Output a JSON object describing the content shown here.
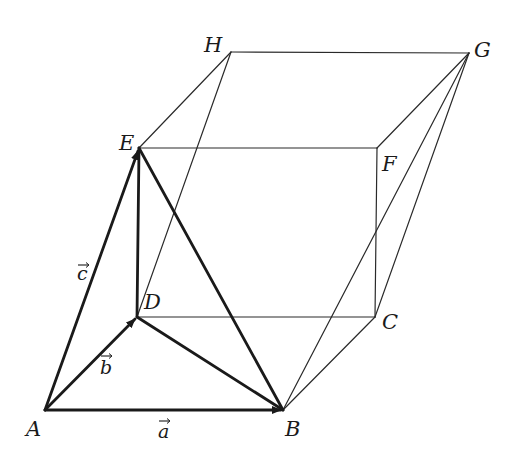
{
  "figure": {
    "type": "parallelepiped-vector-diagram",
    "vertices": {
      "A": {
        "label": "A",
        "x": 45,
        "y": 410
      },
      "B": {
        "label": "B",
        "x": 283,
        "y": 410
      },
      "C": {
        "label": "C",
        "x": 375,
        "y": 317
      },
      "D": {
        "label": "D",
        "x": 137,
        "y": 317
      },
      "E": {
        "label": "E",
        "x": 139,
        "y": 148
      },
      "F": {
        "label": "F",
        "x": 377,
        "y": 148
      },
      "G": {
        "label": "G",
        "x": 469,
        "y": 53
      },
      "H": {
        "label": "H",
        "x": 231,
        "y": 52
      }
    },
    "vectors": {
      "a": {
        "label": "a",
        "from": "A",
        "to": "B"
      },
      "b": {
        "label": "b",
        "from": "A",
        "to": "D"
      },
      "c": {
        "label": "c",
        "from": "A",
        "to": "E"
      }
    },
    "thick_edges": [
      "A-B",
      "A-D",
      "A-E",
      "D-E",
      "D-B",
      "E-B"
    ],
    "thin_edges": [
      "E-F",
      "E-H",
      "H-G",
      "F-G",
      "D-C",
      "B-C",
      "F-C",
      "G-C",
      "D-H",
      "B-G"
    ],
    "colors": {
      "line": "#1a1a1a",
      "background": "#ffffff"
    }
  }
}
